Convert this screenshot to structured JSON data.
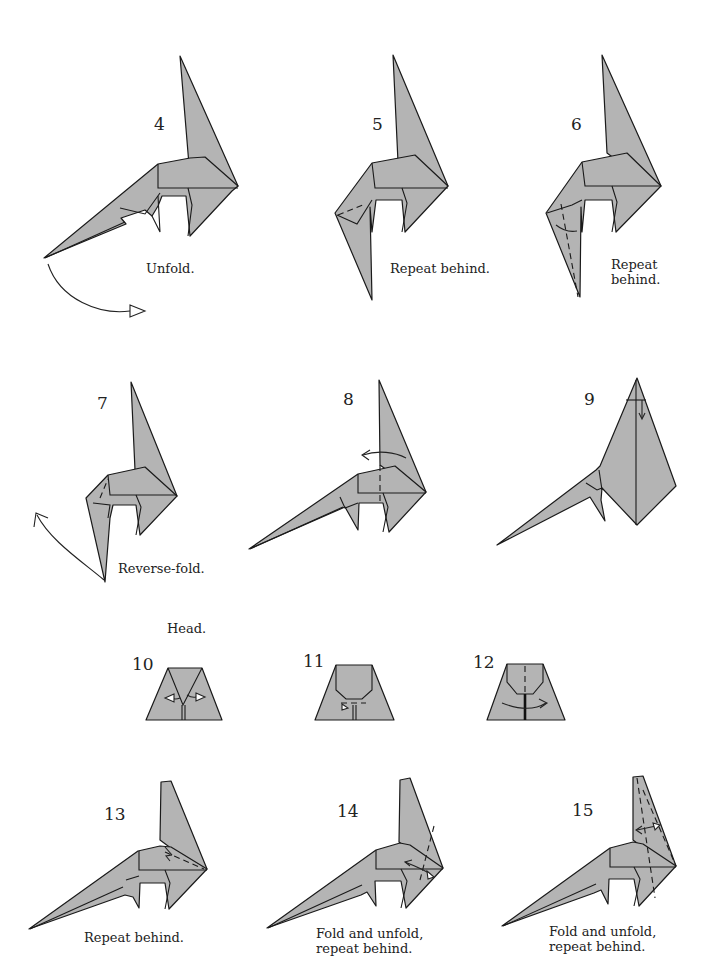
{
  "page": {
    "paper_color": "#b4b4b4",
    "line_color": "#1a1a1a"
  },
  "steps": [
    {
      "number": "4",
      "caption": "Unfold."
    },
    {
      "number": "5",
      "caption": "Repeat behind."
    },
    {
      "number": "6",
      "caption_line1": "Repeat",
      "caption_line2": "behind."
    },
    {
      "number": "7",
      "caption": "Reverse-fold."
    },
    {
      "number": "8",
      "caption": ""
    },
    {
      "number": "9",
      "caption": ""
    },
    {
      "number": "10",
      "caption": ""
    },
    {
      "number": "11",
      "caption": ""
    },
    {
      "number": "12",
      "caption": ""
    },
    {
      "number": "13",
      "caption": "Repeat behind."
    },
    {
      "number": "14",
      "caption_line1": "Fold and unfold,",
      "caption_line2": "repeat behind."
    },
    {
      "number": "15",
      "caption_line1": "Fold and unfold,",
      "caption_line2": "repeat behind."
    }
  ],
  "section_heading": "Head."
}
